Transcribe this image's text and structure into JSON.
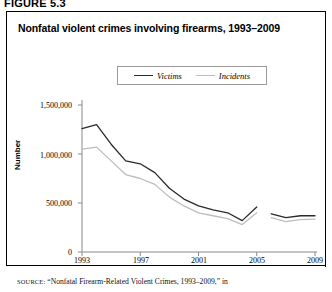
{
  "figure": {
    "number": "FIGURE 5.3",
    "title": "Nonfatal violent crimes involving firearms, 1993–2009",
    "source_prefix": "SOURCE:",
    "source_text": "“Nonfatal Firearm-Related Violent Crimes, 1993–2009,” in"
  },
  "legend": {
    "position": "top-center",
    "items": [
      {
        "label": "Victims",
        "color": "#2a2a2a"
      },
      {
        "label": "Incidents",
        "color": "#bdbdbd"
      }
    ]
  },
  "axes": {
    "ylabel": "Number",
    "yticks": [
      "0",
      "500,000",
      "1,000,000",
      "1,500,000"
    ],
    "xticks": [
      "1993",
      "1997",
      "2001",
      "2005",
      "2009"
    ]
  },
  "chart_data": {
    "type": "line",
    "title": "Nonfatal violent crimes involving firearms, 1993–2009",
    "xlabel": "",
    "ylabel": "Number",
    "xlim": [
      1993,
      2009
    ],
    "ylim": [
      0,
      1500000
    ],
    "grid": false,
    "legend_position": "top-center",
    "note": "Series is interrupted between 2005 and 2006; a separate short segment covers 2006–2009.",
    "x": [
      1993,
      1994,
      1995,
      1996,
      1997,
      1998,
      1999,
      2000,
      2001,
      2002,
      2003,
      2004,
      2005
    ],
    "x_segment2": [
      2006,
      2007,
      2008,
      2009
    ],
    "series": [
      {
        "name": "Victims",
        "color": "#2a2a2a",
        "values": [
          1260000,
          1300000,
          1100000,
          930000,
          900000,
          810000,
          650000,
          540000,
          470000,
          430000,
          400000,
          320000,
          460000
        ],
        "values_segment2": [
          390000,
          350000,
          370000,
          370000
        ]
      },
      {
        "name": "Incidents",
        "color": "#bdbdbd",
        "values": [
          1050000,
          1070000,
          930000,
          790000,
          750000,
          690000,
          560000,
          470000,
          400000,
          370000,
          340000,
          280000,
          400000
        ],
        "values_segment2": [
          350000,
          310000,
          330000,
          335000
        ]
      }
    ]
  }
}
